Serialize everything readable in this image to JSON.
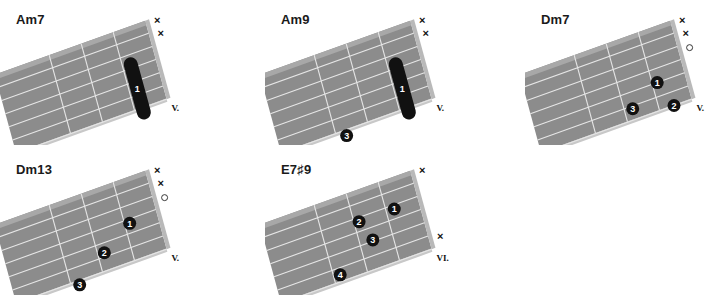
{
  "colors": {
    "fretboard": "#8c8c8c",
    "fretboard_edge": "#a8a8a8",
    "nut": "#b9b9b9",
    "lines": "#e6e6e6",
    "dot": "#111111",
    "dot_text": "#ffffff"
  },
  "chords": [
    {
      "name": "Am7",
      "position": "V.",
      "strings": [
        "x",
        "x",
        "",
        "",
        "",
        ""
      ],
      "barres": [
        {
          "finger": "1",
          "fret": 0.75,
          "from_string": 3,
          "to_string": 6
        }
      ],
      "dots": []
    },
    {
      "name": "Am9",
      "position": "V.",
      "strings": [
        "x",
        "x",
        "",
        "",
        "",
        ""
      ],
      "barres": [
        {
          "finger": "1",
          "fret": 0.75,
          "from_string": 3,
          "to_string": 6
        }
      ],
      "dots": [
        {
          "finger": "3",
          "fret": 2.7,
          "string": 6.4
        }
      ]
    },
    {
      "name": "Dm7",
      "position": "V.",
      "strings": [
        "x",
        "x",
        "o",
        "",
        "",
        ""
      ],
      "barres": [],
      "dots": [
        {
          "finger": "1",
          "fret": 0.85,
          "string": 4
        },
        {
          "finger": "3",
          "fret": 1.75,
          "string": 5.2
        },
        {
          "finger": "2",
          "fret": 0.55,
          "string": 6
        }
      ]
    },
    {
      "name": "Dm13",
      "position": "V.",
      "strings": [
        "x",
        "x",
        "o",
        "",
        "",
        ""
      ],
      "barres": [],
      "dots": [
        {
          "finger": "1",
          "fret": 0.85,
          "string": 3.3
        },
        {
          "finger": "2",
          "fret": 1.8,
          "string": 4.7
        },
        {
          "finger": "3",
          "fret": 2.75,
          "string": 6.3
        }
      ]
    },
    {
      "name": "E7♯9",
      "position": "VI.",
      "strings": [
        "x",
        "",
        "",
        "",
        "",
        "x"
      ],
      "barres": [],
      "dots": [
        {
          "finger": "2",
          "fret": 1.85,
          "string": 2.3
        },
        {
          "finger": "1",
          "fret": 0.75,
          "string": 2.3
        },
        {
          "finger": "3",
          "fret": 1.6,
          "string": 3.9
        },
        {
          "finger": "4",
          "fret": 2.8,
          "string": 5.5
        }
      ]
    }
  ]
}
